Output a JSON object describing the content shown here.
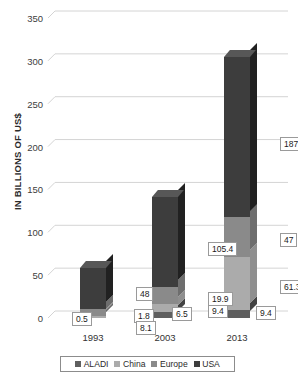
{
  "chart_data": {
    "type": "bar",
    "subtype": "stacked-column-3d",
    "title": "",
    "xlabel": "",
    "ylabel": "IN BILLIONS OF US$",
    "categories": [
      "1993",
      "2003",
      "2013"
    ],
    "series": [
      {
        "name": "ALADI",
        "values": [
          0.5,
          6.5,
          9.4
        ],
        "color": "#5f5f5f"
      },
      {
        "name": "China",
        "values": [
          1.8,
          9.4,
          61.3
        ],
        "color": "#ababab"
      },
      {
        "name": "Europe",
        "values": [
          8.1,
          19.9,
          47
        ],
        "color": "#8a8a8a"
      },
      {
        "name": "USA",
        "values": [
          48,
          105.4,
          187.3
        ],
        "color": "#3d3d3d"
      }
    ],
    "stack_order_bottom_to_top": [
      "ALADI",
      "China",
      "Europe",
      "USA"
    ],
    "totals": [
      58.4,
      141.3,
      305.0
    ],
    "ylim": [
      0,
      350
    ],
    "yticks": [
      0,
      50,
      100,
      150,
      200,
      250,
      300,
      350
    ],
    "ytick_labels": [
      "0",
      "50",
      "100",
      "150",
      "200",
      "250",
      "300",
      "350"
    ],
    "grid": true,
    "grid_color": "#d4d4d4",
    "legend_position": "bottom",
    "legend_entries": [
      "ALADI",
      "China",
      "Europe",
      "USA"
    ],
    "data_labels": [
      {
        "category": "1993",
        "series": "ALADI",
        "text": "0.5"
      },
      {
        "category": "1993",
        "series": "China",
        "text": "1.8"
      },
      {
        "category": "1993",
        "series": "Europe",
        "text": "8.1"
      },
      {
        "category": "1993",
        "series": "USA",
        "text": "48"
      },
      {
        "category": "2003",
        "series": "ALADI",
        "text": "6.5"
      },
      {
        "category": "2003",
        "series": "China",
        "text": "9.4"
      },
      {
        "category": "2003",
        "series": "Europe",
        "text": "19.9"
      },
      {
        "category": "2003",
        "series": "USA",
        "text": "105.4"
      },
      {
        "category": "2013",
        "series": "ALADI",
        "text": "9.4"
      },
      {
        "category": "2013",
        "series": "China",
        "text": "61.3"
      },
      {
        "category": "2013",
        "series": "Europe",
        "text": "47"
      },
      {
        "category": "2013",
        "series": "USA",
        "text": "187.3"
      }
    ]
  }
}
